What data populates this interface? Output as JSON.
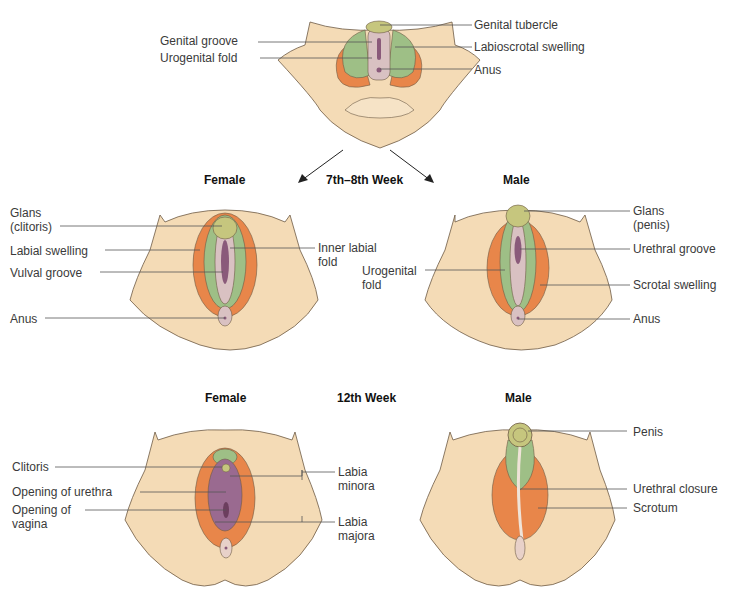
{
  "colors": {
    "skin": "#f4dbb6",
    "skin_stroke": "#6d5a45",
    "green": "#9ebf86",
    "orange": "#e8864a",
    "pink": "#d9c1c2",
    "purple": "#8a5a7a",
    "tubercle": "#c6c67e",
    "leader": "#555555"
  },
  "headers": {
    "stage1": "7th–8th Week",
    "stage2": "12th Week",
    "female1": "Female",
    "male1": "Male",
    "female2": "Female",
    "male2": "Male"
  },
  "indifferent": {
    "labels": {
      "genital_groove": "Genital groove",
      "urogenital_fold": "Urogenital fold",
      "genital_tubercle": "Genital tubercle",
      "labioscrotal_swelling": "Labioscrotal swelling",
      "anus": "Anus"
    }
  },
  "female_7_8": {
    "labels": {
      "glans_line1": "Glans",
      "glans_line2": "(clitoris)",
      "labial_swelling": "Labial swelling",
      "vulval_groove": "Vulval groove",
      "anus": "Anus",
      "inner_labial_line1": "Inner labial",
      "inner_labial_line2": "fold"
    }
  },
  "male_7_8": {
    "labels": {
      "urogenital_line1": "Urogenital",
      "urogenital_line2": "fold",
      "glans_line1": "Glans",
      "glans_line2": "(penis)",
      "urethral_groove": "Urethral groove",
      "scrotal_swelling": "Scrotal swelling",
      "anus": "Anus"
    }
  },
  "female_12": {
    "labels": {
      "clitoris": "Clitoris",
      "opening_urethra": "Opening of urethra",
      "opening_vagina_line1": "Opening of",
      "opening_vagina_line2": "vagina",
      "labia_minora_line1": "Labia",
      "labia_minora_line2": "minora",
      "labia_majora_line1": "Labia",
      "labia_majora_line2": "majora"
    }
  },
  "male_12": {
    "labels": {
      "penis": "Penis",
      "urethral_closure": "Urethral closure",
      "scrotum": "Scrotum"
    }
  }
}
